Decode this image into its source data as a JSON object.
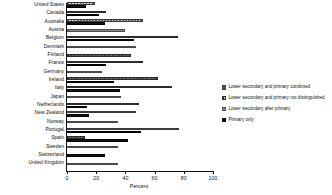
{
  "chart_data": {
    "type": "bar",
    "orientation": "horizontal",
    "title": "",
    "xlabel": "Percent",
    "ylabel": "",
    "xlim": [
      0,
      100
    ],
    "xticks": [
      0,
      20,
      40,
      60,
      80,
      100
    ],
    "grid": false,
    "legend_position": "right",
    "categories": [
      "United States",
      "Canada",
      "Australia",
      "Austria",
      "Belgium",
      "Denmark",
      "Finland",
      "France",
      "Germany",
      "Ireland",
      "Italy",
      "Japan",
      "Netherlands",
      "New Zealand",
      "Norway",
      "Portugal",
      "Spain",
      "Sweden",
      "Switzerland",
      "United Kingdom"
    ],
    "series": [
      {
        "name": "Lower secondary and primary combined",
        "values": [
          19,
          0,
          52,
          0,
          0,
          0,
          0,
          0,
          0,
          0,
          0,
          0,
          0,
          47,
          0,
          77,
          0,
          0,
          0,
          0
        ]
      },
      {
        "name": "Lower secondary and primary not distinguished",
        "values": [
          0,
          27,
          0,
          0,
          76,
          0,
          44,
          52,
          0,
          62,
          72,
          0,
          49,
          0,
          0,
          0,
          12,
          0,
          0,
          0
        ]
      },
      {
        "name": "Lower secondary after primary",
        "values": [
          0,
          0,
          0,
          40,
          0,
          47,
          0,
          0,
          24,
          0,
          0,
          37,
          0,
          0,
          35,
          0,
          0,
          35,
          0,
          35
        ]
      },
      {
        "name": "Primary only",
        "values": [
          13,
          22,
          26,
          0,
          46,
          0,
          0,
          27,
          0,
          32,
          36,
          0,
          14,
          15,
          0,
          51,
          42,
          0,
          26,
          0
        ]
      }
    ]
  },
  "legend": {
    "items": [
      {
        "label": "Lower secondary and primary combined",
        "swatch": "s1"
      },
      {
        "label": "Lower secondary and primary not distinguished",
        "swatch": "s2"
      },
      {
        "label": "Lower secondary after primary",
        "swatch": "s3"
      },
      {
        "label": "Primary only",
        "swatch": "s4"
      }
    ]
  },
  "axis": {
    "x_title": "Percent",
    "tick_labels": [
      "0",
      "20",
      "40",
      "60",
      "80",
      "100"
    ]
  }
}
